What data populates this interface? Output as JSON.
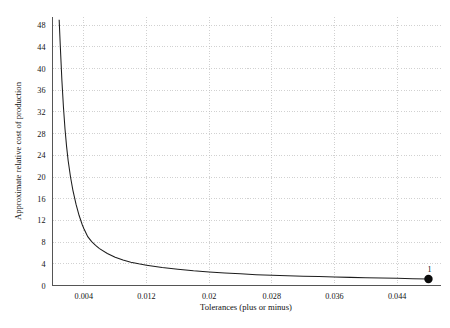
{
  "chart_data": {
    "type": "line",
    "title": "",
    "xlabel": "Tolerances (plus or minus)",
    "ylabel": "Approximate relative cost of production",
    "xlim": [
      0.0,
      0.0496
    ],
    "ylim": [
      0,
      49.5
    ],
    "grid": true,
    "legend": false,
    "xticks": [
      0.004,
      0.012,
      0.02,
      0.028,
      0.036,
      0.044
    ],
    "xtick_labels": [
      "0.004",
      "0.012",
      "0.02",
      "0.028",
      "0.036",
      "0.044"
    ],
    "yticks": [
      0,
      4,
      8,
      12,
      16,
      20,
      24,
      28,
      32,
      36,
      40,
      44,
      48
    ],
    "ytick_labels": [
      "0",
      "4",
      "8",
      "12",
      "16",
      "20",
      "24",
      "28",
      "32",
      "36",
      "40",
      "44",
      "48"
    ],
    "series": [
      {
        "name": "Approximate relative cost of production",
        "x": [
          0.00085,
          0.001,
          0.0012,
          0.0014,
          0.0016,
          0.0018,
          0.002,
          0.0023,
          0.0026,
          0.003,
          0.0034,
          0.0038,
          0.004,
          0.0045,
          0.005,
          0.0055,
          0.006,
          0.007,
          0.008,
          0.009,
          0.01,
          0.011,
          0.012,
          0.014,
          0.016,
          0.018,
          0.02,
          0.022,
          0.024,
          0.026,
          0.028,
          0.03,
          0.032,
          0.034,
          0.036,
          0.038,
          0.04,
          0.042,
          0.044,
          0.046,
          0.048
        ],
        "y": [
          49.0,
          44.0,
          37.8,
          32.8,
          28.8,
          25.6,
          23.0,
          20.0,
          17.6,
          15.0,
          12.9,
          11.2,
          10.5,
          9.0,
          8.1,
          7.4,
          6.8,
          5.9,
          5.2,
          4.7,
          4.3,
          4.0,
          3.75,
          3.3,
          3.0,
          2.7,
          2.5,
          2.3,
          2.15,
          2.0,
          1.9,
          1.8,
          1.72,
          1.64,
          1.57,
          1.5,
          1.44,
          1.38,
          1.32,
          1.26,
          1.2
        ]
      }
    ],
    "annotations": [
      {
        "label": "1",
        "x": 0.048,
        "y": 1.2,
        "marker": "filled-circle"
      }
    ]
  }
}
